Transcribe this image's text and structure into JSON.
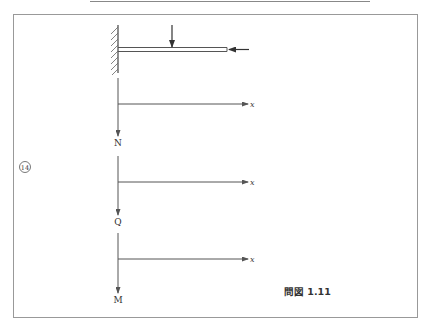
{
  "figure": {
    "caption": "問図 1.11",
    "problem_number": "⑭"
  },
  "beam": {
    "support": "fixed-wall",
    "loads": [
      {
        "type": "vertical-point-load",
        "direction": "down"
      },
      {
        "type": "axial-load",
        "direction": "left"
      }
    ]
  },
  "diagrams": [
    {
      "name": "N",
      "axis_label": "x"
    },
    {
      "name": "Q",
      "axis_label": "x"
    },
    {
      "name": "M",
      "axis_label": "x"
    }
  ],
  "colors": {
    "line": "#555555",
    "frame": "#888888",
    "text": "#333333"
  }
}
